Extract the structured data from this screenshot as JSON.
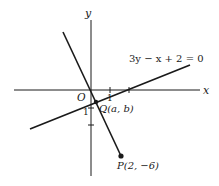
{
  "figure": {
    "axes": {
      "x_label": "x",
      "y_label": "y",
      "origin_label": "O",
      "x_tick_label": "1",
      "y_tick_label": "1"
    },
    "lines": [
      {
        "name": "given-line",
        "equation": "3y − x + 2 = 0"
      },
      {
        "name": "perpendicular-line",
        "from": "P",
        "to": "Q"
      }
    ],
    "points": {
      "Q": {
        "label": "Q(a, b)",
        "x": "a",
        "y": "b"
      },
      "P": {
        "label": "P(2, −6)",
        "x": 2,
        "y": -6
      }
    },
    "colors": {
      "ink": "#1a1a1a",
      "background": "#ffffff"
    }
  }
}
